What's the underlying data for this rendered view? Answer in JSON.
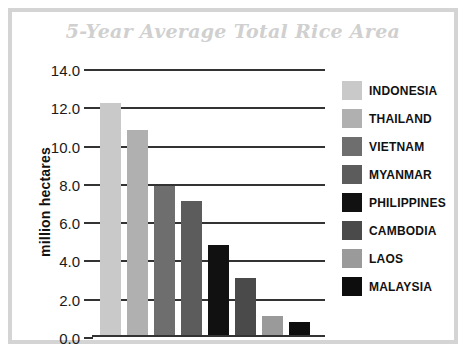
{
  "chart_data": {
    "type": "bar",
    "title": "5-Year Average Total Rice Area",
    "xlabel": "",
    "ylabel": "million hectares",
    "ylim": [
      0.0,
      14.0
    ],
    "ytick_step": 2.0,
    "ytick_labels": [
      "14.0",
      "12.0",
      "10.0",
      "8.0",
      "6.0",
      "4.0",
      "2.0",
      "0.0"
    ],
    "ytick_values": [
      14.0,
      12.0,
      10.0,
      8.0,
      6.0,
      4.0,
      2.0,
      0.0
    ],
    "grid": true,
    "grid_axis": "y",
    "legend_position": "right",
    "categories": [
      "INDONESIA",
      "THAILAND",
      "VIETNAM",
      "MYANMAR",
      "PHILIPPINES",
      "CAMBODIA",
      "LAOS",
      "MALAYSIA"
    ],
    "values": [
      12.1,
      10.7,
      7.8,
      7.0,
      4.7,
      3.0,
      1.0,
      0.7
    ],
    "colors": [
      "#c9c9c9",
      "#b0b0b0",
      "#6e6e6e",
      "#5c5c5c",
      "#111111",
      "#4a4a4a",
      "#9a9a9a",
      "#0d0d0d"
    ]
  },
  "title_color": "#d0d0d0",
  "frame_color": "#d4d4d4",
  "axis_color": "#333333"
}
